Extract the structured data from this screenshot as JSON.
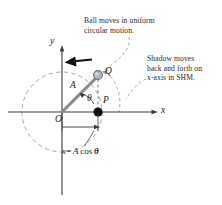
{
  "figure": {
    "title_note": "Uniform circular motion and simple harmonic motion projection diagram",
    "width": 222,
    "height": 205
  },
  "annotations": {
    "ball_note_line1": "Ball moves in uniform",
    "ball_note_line2": "circular motion.",
    "shadow_note_line1": "Shadow moves",
    "shadow_note_line2": "back and forth on",
    "shadow_note_line3": "x-axis in SHM."
  },
  "labels": {
    "axis_x": "x",
    "axis_y": "y",
    "origin": "O",
    "ball_point": "Q",
    "shadow_point": "P",
    "radius": "A",
    "angle": "θ"
  },
  "equation": {
    "lhs": "x",
    "operator": "=",
    "rhs_amplitude": "A",
    "rhs_function": "cos",
    "rhs_angle": "θ",
    "full": "x = A cos θ"
  },
  "geometry": {
    "origin_x": 62,
    "origin_y": 112,
    "circle_radius": 40,
    "ball_x": 98,
    "ball_y": 75,
    "shadow_x": 98,
    "shadow_y": 112,
    "x_axis_start": 8,
    "x_axis_end": 158,
    "y_axis_top": 45,
    "y_axis_bottom": 195,
    "measure_arrow_y": 127,
    "motion_arrow_y": 60,
    "angle_degrees": 46
  },
  "colors": {
    "axis": "#3a3a3a",
    "circle_dashed": "#9a9aa8",
    "radius_vector": "#8a8a92",
    "ball_fill": "#b8b8bc",
    "ball_stroke": "#6e6e76",
    "shadow_dot": "#111111",
    "motion_arrow": "#111111",
    "text": "#2b2b2b",
    "leader": "#9a9aa8",
    "background": "#ffffff"
  }
}
